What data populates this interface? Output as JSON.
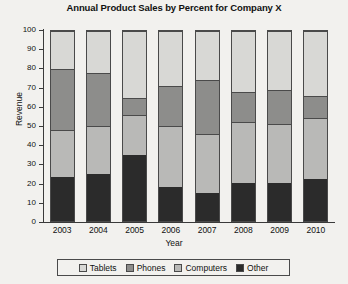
{
  "chart_data": {
    "type": "bar",
    "subtype": "stacked-bar-100-percent",
    "title": "Annual Product Sales by Percent for Company X",
    "xlabel": "Year",
    "ylabel": "Revenue",
    "categories": [
      "2003",
      "2004",
      "2005",
      "2006",
      "2007",
      "2008",
      "2009",
      "2010"
    ],
    "ylim": [
      0,
      100
    ],
    "yticks": [
      0,
      10,
      20,
      30,
      40,
      50,
      60,
      70,
      80,
      90,
      100
    ],
    "grid": false,
    "legend_position": "bottom",
    "stack_order_bottom_to_top": [
      "Other",
      "Computers",
      "Phones",
      "Tablets"
    ],
    "series": [
      {
        "name": "Other",
        "color": "#2b2b2b",
        "values": [
          23,
          25,
          35,
          18,
          15,
          20,
          20,
          22
        ]
      },
      {
        "name": "Computers",
        "color": "#b9b9b7",
        "values": [
          25,
          25,
          21,
          32,
          31,
          32,
          31,
          32
        ]
      },
      {
        "name": "Phones",
        "color": "#8d8d8b",
        "values": [
          32,
          28,
          9,
          21,
          28,
          16,
          18,
          12
        ]
      },
      {
        "name": "Tablets",
        "color": "#d8d8d5",
        "values": [
          20,
          22,
          35,
          29,
          26,
          32,
          31,
          34
        ]
      }
    ],
    "cumulative_tops": {
      "Other": [
        23,
        25,
        35,
        18,
        15,
        20,
        20,
        22
      ],
      "Computers": [
        48,
        50,
        56,
        50,
        46,
        52,
        51,
        54
      ],
      "Phones": [
        80,
        78,
        65,
        71,
        74,
        68,
        69,
        66
      ],
      "Tablets": [
        100,
        100,
        100,
        100,
        100,
        100,
        100,
        100
      ]
    }
  },
  "legend": {
    "items": [
      {
        "label": "Tablets",
        "color": "#d8d8d5"
      },
      {
        "label": "Phones",
        "color": "#8d8d8b"
      },
      {
        "label": "Computers",
        "color": "#b9b9b7"
      },
      {
        "label": "Other",
        "color": "#2b2b2b"
      }
    ]
  }
}
